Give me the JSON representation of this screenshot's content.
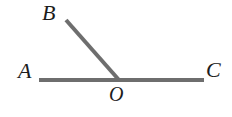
{
  "figure": {
    "name": "angle-diagram",
    "width": 232,
    "height": 117,
    "background_color": "#ffffff",
    "stroke_color": "#6e6e6e",
    "label_color": "#1c1c1c",
    "stroke_width": 4
  },
  "labels": {
    "a": "A",
    "b": "B",
    "c": "C",
    "o": "O"
  },
  "chart_data": {
    "type": "scatter",
    "title": "",
    "xlabel": "",
    "ylabel": "",
    "xlim": [
      0,
      232
    ],
    "ylim": [
      0,
      117
    ],
    "grid": false,
    "points": [
      {
        "name": "A",
        "x": 39,
        "y": 80
      },
      {
        "name": "O",
        "x": 119,
        "y": 80
      },
      {
        "name": "C",
        "x": 204,
        "y": 80
      },
      {
        "name": "B",
        "x": 66,
        "y": 20
      }
    ],
    "segments": [
      {
        "name": "AC",
        "from": "A",
        "to": "C",
        "color": "#6e6e6e",
        "width": 4
      },
      {
        "name": "OB",
        "from": "O",
        "to": "B",
        "color": "#6e6e6e",
        "width": 4
      }
    ],
    "annotations": [
      {
        "text": "A",
        "x": 18,
        "y": 60
      },
      {
        "text": "B",
        "x": 42,
        "y": 2
      },
      {
        "text": "C",
        "x": 206,
        "y": 59
      },
      {
        "text": "O",
        "x": 109,
        "y": 84
      }
    ]
  }
}
